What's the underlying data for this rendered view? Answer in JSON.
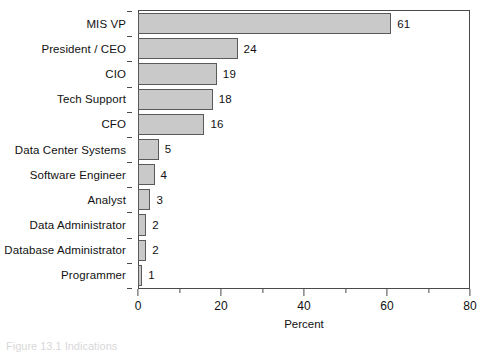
{
  "chart_data": {
    "type": "bar",
    "orientation": "horizontal",
    "title": "",
    "xlabel": "Percent",
    "ylabel": "",
    "xlim": [
      0,
      80
    ],
    "xticks": [
      0,
      20,
      40,
      60,
      80
    ],
    "xtick_labels": [
      "0",
      "20",
      "40",
      "60",
      "80"
    ],
    "minor_xticks": [
      10,
      30,
      50,
      70
    ],
    "grid": false,
    "legend": null,
    "categories": [
      "MIS VP",
      "President /  CEO",
      "CIO",
      "Tech Support",
      "CFO",
      "Data Center Systems",
      "Software Engineer",
      "Analyst",
      "Data Administrator",
      "Database Administrator",
      "Programmer"
    ],
    "values": [
      61,
      24,
      19,
      18,
      16,
      5,
      4,
      3,
      2,
      2,
      1
    ],
    "value_labels": [
      "61",
      "24",
      "19",
      "18",
      "16",
      "5",
      "4",
      "3",
      "2",
      "2",
      "1"
    ],
    "bar_color": "#c9c9c9",
    "bar_edge_color": "#5a5a5a",
    "axis_color": "#4a4a4a"
  },
  "caption": {
    "text": "Figure 13.1  Indications"
  }
}
